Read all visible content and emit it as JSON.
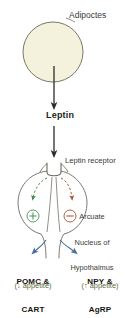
{
  "figure": {
    "background_color": "#ffffff"
  },
  "labels": {
    "adipocytes": "Adipoctes",
    "leptin": "Leptin",
    "leptin_receptor": "Leptin receptor",
    "arcuate_nucleus_line1": "Arcuate",
    "arcuate_nucleus_line2": "Nucleus of",
    "arcuate_nucleus_line3": "Hypothalmus",
    "pomc_line1": "POMC &",
    "pomc_line2": "CART",
    "npy_line1": "NPY &",
    "npy_line2": "AgRP",
    "appetite_down": "(↓ appetite)",
    "appetite_up": "(↑ appetite)"
  },
  "nodes": {
    "adipocyte_cell": {
      "shape": "circle",
      "fill_color": "#f4f1dc",
      "stroke_color": "#6b6a55",
      "center_x": 53,
      "center_y": 52,
      "radius": 30
    },
    "neuron_cell": {
      "shape": "circle",
      "fill_color": "#ffffff",
      "stroke_color": "#6e6a60",
      "center_x": 50,
      "center_y": 203,
      "radius": 32
    },
    "receptor": {
      "shape": "u-channel",
      "stroke_color": "#6e6a60",
      "name": "leptin-receptor-glyph"
    },
    "plus_node": {
      "symbol": "+",
      "color": "#3f8a4e",
      "center_x": 33,
      "center_y": 216,
      "radius": 6
    },
    "minus_node": {
      "symbol": "−",
      "color": "#9d4a2a",
      "center_x": 70,
      "center_y": 216,
      "radius": 6
    }
  },
  "arrows": {
    "adipocyte_to_leptin": {
      "color": "#2b2b2b",
      "style": "solid",
      "direction": "down"
    },
    "leptin_to_receptor": {
      "color": "#2b2b2b",
      "style": "solid",
      "direction": "down"
    },
    "receptor_to_plus": {
      "color": "#3f8a4e",
      "style": "dashed",
      "direction": "down-left",
      "meaning": "activates"
    },
    "receptor_to_minus": {
      "color": "#a8532f",
      "style": "dashed",
      "direction": "down-right",
      "meaning": "inhibits"
    },
    "neuron_to_pomc": {
      "color": "#4a6e9c",
      "style": "solid",
      "direction": "down-left"
    },
    "neuron_to_npy": {
      "color": "#4a6e9c",
      "style": "solid",
      "direction": "down-right"
    }
  },
  "colors": {
    "adipocyte_fill": "#f4f1dc",
    "outline": "#6e6a60",
    "arrow_dark": "#2b2b2b",
    "arrow_blue": "#4a6e9c",
    "activate_green": "#3f8a4e",
    "inhibit_red": "#a8532f",
    "appetite_text": "#5d6b3c",
    "label_text": "#3a3a3a"
  }
}
